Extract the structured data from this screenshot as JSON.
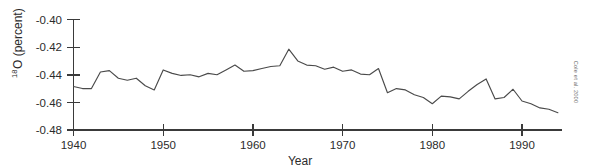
{
  "chart_data": {
    "type": "line",
    "title": "",
    "xlabel": "Year",
    "ylabel": "18O (percent)",
    "ylabel_superscript": "18",
    "ylabel_main": "O (percent)",
    "xlim": [
      1940,
      1994
    ],
    "ylim": [
      -0.48,
      -0.4
    ],
    "grid": false,
    "legend": false,
    "annotation": "Cole et al. 2000",
    "xticks": [
      1940,
      1950,
      1960,
      1970,
      1980,
      1990
    ],
    "xtick_labels": [
      "1940",
      "1950",
      "1960",
      "1970",
      "1980",
      "1990"
    ],
    "yticks": [
      -0.4,
      -0.42,
      -0.44,
      -0.46,
      -0.48
    ],
    "ytick_labels": [
      "-0.40",
      "-0.42",
      "-0.44",
      "-0.46",
      "-0.48"
    ],
    "series": [
      {
        "name": "d18O",
        "x": [
          1940,
          1941,
          1942,
          1943,
          1944,
          1945,
          1946,
          1947,
          1948,
          1949,
          1950,
          1951,
          1952,
          1953,
          1954,
          1955,
          1956,
          1957,
          1958,
          1959,
          1960,
          1961,
          1962,
          1963,
          1964,
          1965,
          1966,
          1967,
          1968,
          1969,
          1970,
          1971,
          1972,
          1973,
          1974,
          1975,
          1976,
          1977,
          1978,
          1979,
          1980,
          1981,
          1982,
          1983,
          1984,
          1985,
          1986,
          1987,
          1988,
          1989,
          1990,
          1991,
          1992,
          1993,
          1994
        ],
        "values": [
          -0.4485,
          -0.45,
          -0.45,
          -0.438,
          -0.437,
          -0.4425,
          -0.444,
          -0.4425,
          -0.448,
          -0.451,
          -0.4365,
          -0.439,
          -0.4405,
          -0.44,
          -0.4415,
          -0.439,
          -0.44,
          -0.4365,
          -0.433,
          -0.4375,
          -0.437,
          -0.4355,
          -0.434,
          -0.4335,
          -0.4215,
          -0.43,
          -0.433,
          -0.4335,
          -0.436,
          -0.4345,
          -0.4375,
          -0.4365,
          -0.4395,
          -0.44,
          -0.4355,
          -0.453,
          -0.45,
          -0.451,
          -0.4545,
          -0.4565,
          -0.461,
          -0.4555,
          -0.456,
          -0.4575,
          -0.452,
          -0.447,
          -0.443,
          -0.4575,
          -0.4565,
          -0.4505,
          -0.459,
          -0.461,
          -0.464,
          -0.465,
          -0.4675
        ]
      }
    ]
  },
  "axes": {
    "y_axis_label_superscript": "18",
    "y_axis_label_text": "O (percent)",
    "x_axis_label_text": "Year"
  },
  "credit": {
    "text": "Cole et al. 2000"
  }
}
